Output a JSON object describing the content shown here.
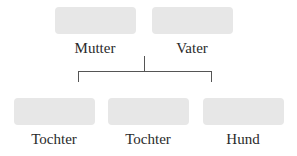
{
  "diagram": {
    "type": "family-tree",
    "colors": {
      "box_fill": "#e7e7e7",
      "line": "#555555",
      "text": "#2a2a2a"
    },
    "parents": [
      {
        "label": "Mutter"
      },
      {
        "label": "Vater"
      }
    ],
    "children": [
      {
        "label": "Tochter"
      },
      {
        "label": "Tochter"
      },
      {
        "label": "Hund"
      }
    ]
  }
}
